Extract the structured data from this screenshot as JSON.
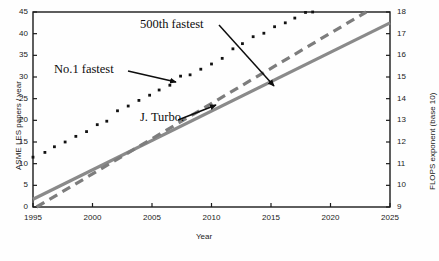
{
  "chart_data": {
    "type": "scatter",
    "title": "",
    "xlabel": "Year",
    "ylabel": "ASME LES papers / year",
    "y2label": "FLOPS exponent (base 10)",
    "xlim": [
      1995,
      2025
    ],
    "ylim": [
      0,
      45
    ],
    "y2lim": [
      9,
      18
    ],
    "xticks": [
      "1995",
      "2000",
      "2005",
      "2010",
      "2015",
      "2020",
      "2025"
    ],
    "xtick_values": [
      1995,
      2000,
      2005,
      2010,
      2015,
      2020,
      2025
    ],
    "yticks": [
      "0",
      "5",
      "10",
      "15",
      "20",
      "25",
      "30",
      "35",
      "40",
      "45"
    ],
    "ytick_values": [
      0,
      5,
      10,
      15,
      20,
      25,
      30,
      35,
      40,
      45
    ],
    "y2ticks": [
      "9",
      "10",
      "11",
      "12",
      "13",
      "14",
      "15",
      "16",
      "17",
      "18"
    ],
    "y2tick_values": [
      9,
      10,
      11,
      12,
      13,
      14,
      15,
      16,
      17,
      18
    ],
    "grid": false,
    "legend": "annotations-inline",
    "series": [
      {
        "name": "No.1 fastest",
        "style": "dotted-markers",
        "axis": "right",
        "color": "#111111",
        "x": [
          1995,
          1996,
          1996.8,
          1997.7,
          1998.6,
          1999.5,
          2000.4,
          2001.2,
          2002.1,
          2003,
          2003.9,
          2004.8,
          2005.6,
          2006.5,
          2007.4,
          2008.2,
          2009.1,
          2010,
          2010.9,
          2011.8,
          2012.6,
          2013.5,
          2014.4,
          2015.3,
          2016.2,
          2017,
          2017.9,
          2018.5
        ],
        "y_left": [
          11.5,
          12.6,
          13.9,
          15.0,
          16.3,
          17.4,
          19.0,
          19.8,
          22.2,
          23.3,
          24.6,
          25.8,
          27.0,
          28.1,
          30.2,
          30.5,
          31.8,
          33.0,
          34.3,
          36.5,
          37.7,
          39.3,
          40.1,
          41.6,
          42.5,
          43.6,
          44.9,
          45.0
        ],
        "y_right": [
          11.3,
          11.52,
          11.78,
          12.0,
          12.26,
          12.48,
          12.8,
          12.96,
          13.44,
          13.66,
          13.92,
          14.16,
          14.4,
          14.62,
          15.04,
          15.1,
          15.36,
          15.6,
          15.86,
          16.3,
          16.54,
          16.86,
          17.02,
          17.32,
          17.5,
          17.72,
          17.98,
          18.0
        ]
      },
      {
        "name": "500th fastest",
        "style": "dashed",
        "axis": "right",
        "color": "#7d7d7d",
        "x": [
          1995.3,
          2023.0
        ],
        "y_left": [
          0.0,
          45.0
        ],
        "y_right": [
          9.0,
          18.0
        ]
      },
      {
        "name": "J. Turbo.",
        "style": "solid",
        "axis": "left",
        "color": "#8a8a8a",
        "x": [
          1995,
          2025
        ],
        "y_left": [
          1.8,
          42.5
        ],
        "y_right": [
          9.36,
          17.5
        ]
      }
    ],
    "annotations": [
      {
        "text": "500th fastest",
        "target_series": "500th fastest",
        "x": 2007.0,
        "y": 42.0
      },
      {
        "text": "No.1 fastest",
        "target_series": "No.1 fastest",
        "x": 1999.0,
        "y": 33.0
      },
      {
        "text": "J. Turbo.",
        "target_series": "J. Turbo.",
        "x": 2004.5,
        "y": 22.5
      }
    ]
  },
  "axes": {
    "xlabel": "Year",
    "ylabel": "ASME LES papers / year",
    "y2label": "FLOPS exponent (base 10)"
  },
  "annotations": {
    "a500th": "500th fastest",
    "no1": "No.1 fastest",
    "jturbo": "J. Turbo."
  },
  "colors": {
    "frame": "#1a1a1a",
    "dots": "#111111",
    "dashed": "#7d7d7d",
    "solid": "#8a8a8a",
    "text": "#1a1a1a",
    "background": "#ffffff"
  }
}
